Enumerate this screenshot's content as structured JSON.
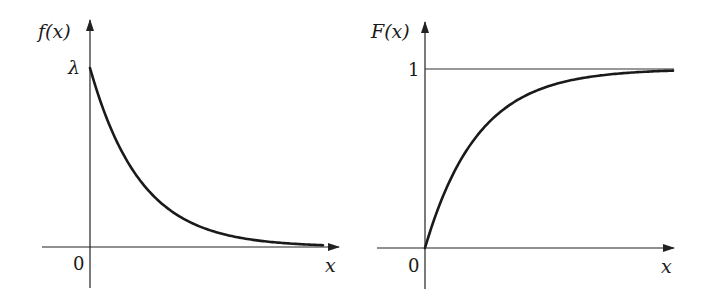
{
  "chart_data": [
    {
      "type": "line",
      "title": "",
      "ylabel": "f(x)",
      "xlabel": "x",
      "origin_label": "0",
      "y_tick_labels": [
        "λ"
      ],
      "description": "Exponential probability density function f(x) = λe^{-λx}, starting at λ at x=0 and decaying toward 0",
      "x": [
        0,
        0.5,
        1,
        1.5,
        2,
        2.5,
        3,
        3.5,
        4,
        4.5,
        5
      ],
      "values": [
        1.0,
        0.607,
        0.368,
        0.223,
        0.135,
        0.082,
        0.05,
        0.03,
        0.018,
        0.011,
        0.007
      ],
      "value_units": "fraction of λ",
      "ylim": [
        0,
        1.2
      ],
      "grid": false,
      "legend": null
    },
    {
      "type": "line",
      "title": "",
      "ylabel": "F(x)",
      "xlabel": "x",
      "origin_label": "0",
      "y_tick_labels": [
        "1"
      ],
      "description": "Exponential cumulative distribution function F(x) = 1 - e^{-λx}, rising from 0 toward the horizontal asymptote y=1",
      "x": [
        0,
        0.5,
        1,
        1.5,
        2,
        2.5,
        3,
        3.5,
        4,
        4.5,
        5
      ],
      "values": [
        0.0,
        0.393,
        0.632,
        0.777,
        0.865,
        0.918,
        0.95,
        0.97,
        0.982,
        0.989,
        0.993
      ],
      "asymptote": 1,
      "ylim": [
        0,
        1.2
      ],
      "grid": false,
      "legend": null
    }
  ],
  "left": {
    "ylabel": "f(x)",
    "xlabel": "x",
    "origin": "0",
    "ytick": "λ"
  },
  "right": {
    "ylabel": "F(x)",
    "xlabel": "x",
    "origin": "0",
    "ytick": "1"
  }
}
